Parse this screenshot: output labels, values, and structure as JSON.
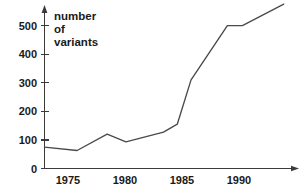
{
  "chart_data": {
    "type": "line",
    "title": "",
    "subtitle": "",
    "xlabel": "",
    "ylabel": "number of variants",
    "ylabel_lines": [
      "number",
      "of",
      "variants"
    ],
    "xlim": [
      1973.4,
      1992.6
    ],
    "ylim": [
      0,
      580
    ],
    "grid": false,
    "legend": null,
    "x_tick_labels": [
      "1975",
      "1980",
      "1985",
      "1990"
    ],
    "x_ticks": [
      1975,
      1980,
      1985,
      1990
    ],
    "y_tick_labels": [
      "0",
      "100",
      "200",
      "300",
      "400",
      "500"
    ],
    "y_ticks": [
      0,
      100,
      200,
      300,
      400,
      500
    ],
    "series": [
      {
        "name": "number of variants",
        "color": "#4a4a4a",
        "x": [
          1973.4,
          1976.0,
          1978.4,
          1979.9,
          1982.9,
          1984.0,
          1985.1,
          1988.0,
          1989.2,
          1992.5
        ],
        "values": [
          75,
          63,
          120,
          93,
          127,
          155,
          310,
          500,
          500,
          575
        ]
      }
    ]
  },
  "axes": {
    "y_axis_name": "vertical-axis",
    "x_axis_name": "horizontal-axis",
    "axis_color": "#3a3a3a"
  }
}
